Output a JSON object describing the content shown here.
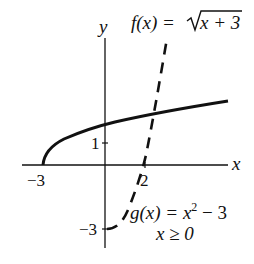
{
  "figure": {
    "axes": {
      "x_label": "x",
      "y_label": "y",
      "x_ticks": [
        {
          "value": -3,
          "label": "−3"
        },
        {
          "value": 2,
          "label": "2"
        }
      ],
      "y_ticks": [
        {
          "value": 1,
          "label": "1"
        },
        {
          "value": -3,
          "label": "−3"
        }
      ]
    },
    "curves": [
      {
        "name": "f",
        "equation_lhs": "f(x) = ",
        "equation_radical": "x + 3",
        "style": "solid",
        "domain": "x ≥ −3"
      },
      {
        "name": "g",
        "equation_lhs": "g(x) = x",
        "equation_exp": "2",
        "equation_rest": " − 3",
        "condition": "x ≥ 0",
        "style": "dashed"
      }
    ],
    "colors": {
      "ink": "#111111",
      "background": "#ffffff"
    }
  }
}
